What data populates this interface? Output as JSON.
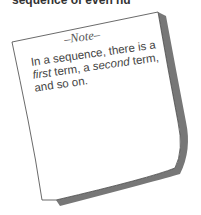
{
  "header": {
    "partial_text": "sequence of even nu"
  },
  "note": {
    "title": "–Note–",
    "body_parts": [
      {
        "text": "In a sequence, there is a ",
        "italic": false
      },
      {
        "text": "first",
        "italic": true
      },
      {
        "text": " term, a ",
        "italic": false
      },
      {
        "text": "second",
        "italic": true
      },
      {
        "text": " term, and so on.",
        "italic": false
      }
    ]
  },
  "colors": {
    "paper": "#ffffff",
    "outline": "#444444",
    "shadow": "#777777",
    "text": "#444444"
  }
}
